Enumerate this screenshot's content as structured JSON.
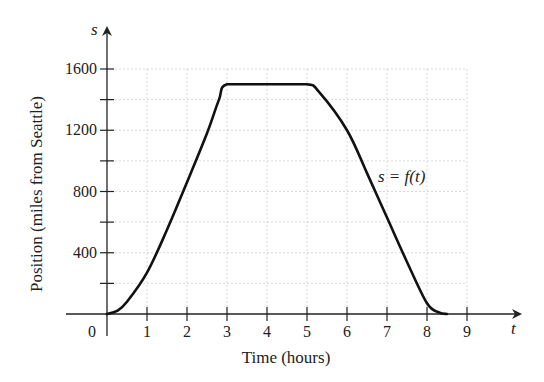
{
  "chart_data": {
    "type": "line",
    "title": "",
    "xlabel": "Time (hours)",
    "ylabel": "Position (miles from Seattle)",
    "x_axis_var": "t",
    "y_axis_var": "s",
    "xlim": [
      0,
      9
    ],
    "ylim": [
      0,
      1600
    ],
    "x_ticks": [
      1,
      2,
      3,
      4,
      5,
      6,
      7,
      8,
      9
    ],
    "y_ticks_labeled": [
      400,
      800,
      1200,
      1600
    ],
    "y_ticks_minor": [
      200,
      600,
      1000,
      1400
    ],
    "origin_label": "0",
    "grid": true,
    "annotation": "s = f(t)",
    "series": [
      {
        "name": "s = f(t)",
        "x": [
          0,
          0.25,
          0.5,
          1,
          1.5,
          2,
          2.5,
          2.8,
          3,
          4,
          5,
          5.3,
          6,
          6.5,
          7,
          7.5,
          8,
          8.3,
          8.5
        ],
        "y": [
          0,
          20,
          80,
          270,
          550,
          860,
          1180,
          1400,
          1500,
          1500,
          1500,
          1450,
          1200,
          920,
          630,
          340,
          70,
          10,
          0
        ]
      }
    ]
  }
}
